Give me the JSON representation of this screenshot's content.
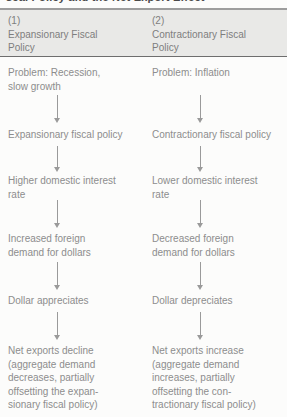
{
  "figure": {
    "title_cutoff": "scal Policy and the Net Export Effect",
    "columns": [
      {
        "number": "(1)",
        "heading": "(1)\nExpansionary Fiscal\nPolicy",
        "steps": [
          "Problem: Recession,\nslow growth",
          "Expansionary fiscal policy",
          "Higher domestic interest\nrate",
          "Increased foreign\ndemand for dollars",
          "Dollar appreciates",
          "Net exports decline\n(aggregate demand\ndecreases, partially\noffsetting the expan-\nsionary fiscal policy)"
        ]
      },
      {
        "number": "(2)",
        "heading": "(2)\nContractionary Fiscal\nPolicy",
        "steps": [
          "Problem: Inflation",
          "Contractionary fiscal policy",
          "Lower domestic interest\nrate",
          "Decreased foreign\ndemand for dollars",
          "Dollar depreciates",
          "Net exports increase\n(aggregate demand\nincreases, partially\noffsetting the con-\ntractionary fiscal policy)"
        ]
      }
    ],
    "arrow_icon": "down-arrow-icon",
    "colors": {
      "text": "#8d8d8d",
      "heading": "#7e7e7e",
      "band": "#e9e9e7",
      "rule": "#6e6e6e",
      "arrow": "#9a9a9a",
      "background": "#fcfcfb"
    }
  }
}
